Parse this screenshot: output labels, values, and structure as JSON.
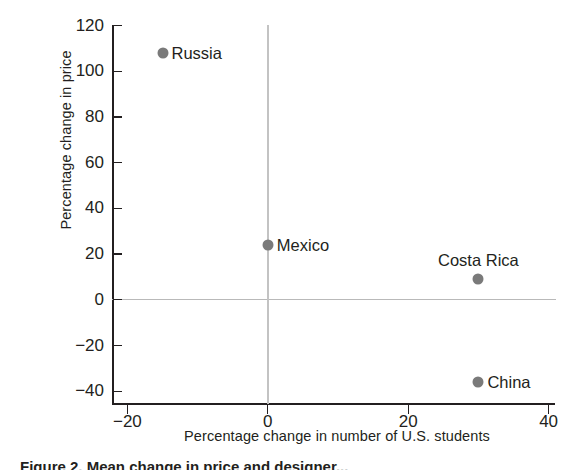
{
  "chart_data": {
    "type": "scatter",
    "title": "",
    "xlabel": "Percentage change in number of U.S. students",
    "ylabel": "Percentage change in price",
    "xlim": [
      -22,
      40
    ],
    "ylim": [
      -46,
      128
    ],
    "xticks": [
      -20,
      0,
      20,
      40
    ],
    "xticklabels": [
      "−20",
      "0",
      "20",
      "40"
    ],
    "yticks": [
      -40,
      -20,
      0,
      20,
      40,
      60,
      80,
      100,
      120
    ],
    "yticklabels": [
      "−40",
      "−20",
      "0",
      "20",
      "40",
      "60",
      "80",
      "100",
      "120"
    ],
    "grid": false,
    "legend": "none",
    "reference_lines": [
      {
        "axis": "y",
        "value": 0,
        "color": "#b9b9b9"
      },
      {
        "axis": "x",
        "value": 0,
        "color": "#c3c3c3"
      }
    ],
    "marker_color": "#7a7a7a",
    "points": [
      {
        "label": "Russia",
        "x": -15,
        "y": 108,
        "label_position": "right"
      },
      {
        "label": "Mexico",
        "x": 0,
        "y": 24,
        "label_position": "right"
      },
      {
        "label": "Costa Rica",
        "x": 30,
        "y": 9,
        "label_position": "above"
      },
      {
        "label": "China",
        "x": 30,
        "y": -36,
        "label_position": "right"
      }
    ]
  },
  "caption": {
    "text": "Figure 2. Mean change in price and designer..."
  }
}
